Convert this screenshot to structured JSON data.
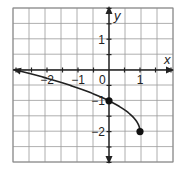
{
  "chart_data": {
    "type": "line",
    "title": "",
    "xlabel": "x",
    "ylabel": "y",
    "xlim": [
      -3,
      2
    ],
    "ylim": [
      -3,
      2
    ],
    "grid": true,
    "grid_step": 0.5,
    "x_tick_labels": [
      {
        "value": -2,
        "label": "−2"
      },
      {
        "value": -1,
        "label": "−1"
      },
      {
        "value": 0,
        "label": "0"
      },
      {
        "value": 1,
        "label": "1"
      }
    ],
    "y_tick_labels": [
      {
        "value": 1,
        "label": "1"
      },
      {
        "value": -1,
        "label": "−1"
      },
      {
        "value": -2,
        "label": "−2"
      }
    ],
    "series": [
      {
        "name": "y = -2 + sqrt(1 - x)",
        "function": "y = -2 + sqrt(1 - x)",
        "x": [
          -3,
          -2,
          -1,
          0,
          0.5,
          0.75,
          1
        ],
        "values": [
          0,
          -0.27,
          -0.59,
          -1,
          -1.29,
          -1.5,
          -2
        ],
        "left_end": "arrow",
        "right_end": "closed-point"
      }
    ],
    "marked_points": [
      {
        "x": 0,
        "y": -1,
        "style": "filled"
      },
      {
        "x": 1,
        "y": -2,
        "style": "filled"
      }
    ],
    "axes_arrows": true
  },
  "labels": {
    "x_axis": "x",
    "y_axis": "y"
  }
}
